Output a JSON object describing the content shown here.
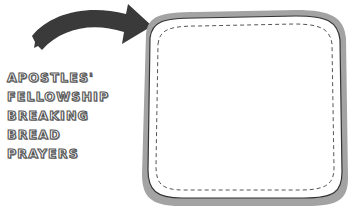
{
  "words": [
    "APOSTLES'",
    "FELLOWSHIP",
    "BREAKING",
    "BREAD",
    "PRAYERS"
  ],
  "colors": {
    "arrow": "#3a3a3a",
    "frame_outer": "#9e9e9e",
    "frame_border": "#333333",
    "frame_fill": "#ffffff",
    "dash": "#555555",
    "text_outline": "#555555"
  }
}
